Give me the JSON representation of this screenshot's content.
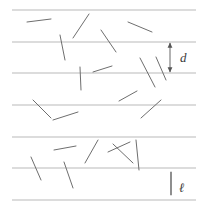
{
  "figure": {
    "name": "buffon-needle-diagram",
    "width": 206,
    "height": 208,
    "background_color": "#ffffff",
    "line_color": "#b9b9b9",
    "needle_color": "#6e6e6e",
    "annotation_color": "#555555",
    "label_color": "#3a3a3a"
  },
  "labels": {
    "spacing": "d",
    "needle_length": "ℓ"
  },
  "chart_data": {
    "type": "scatter",
    "xlabel": "",
    "ylabel": "",
    "grid": true,
    "legend": "none",
    "xlim": [
      0,
      206
    ],
    "ylim": [
      0,
      208
    ],
    "ruled_lines": {
      "orientation": "horizontal",
      "spacing_px": 31.5,
      "x_start": 12,
      "x_end": 196,
      "y_values": [
        10,
        42,
        73,
        105,
        137,
        168,
        200
      ]
    },
    "needles": [
      {
        "id": 1,
        "x1": 27,
        "y1": 22,
        "x2": 51,
        "y2": 19,
        "crosses": false
      },
      {
        "id": 2,
        "x1": 73,
        "y1": 38,
        "x2": 89,
        "y2": 14,
        "crosses": false
      },
      {
        "id": 3,
        "x1": 128,
        "y1": 22,
        "x2": 152,
        "y2": 32,
        "crosses": false
      },
      {
        "id": 4,
        "x1": 60,
        "y1": 35,
        "x2": 65,
        "y2": 60,
        "crosses": true
      },
      {
        "id": 5,
        "x1": 101,
        "y1": 30,
        "x2": 116,
        "y2": 52,
        "crosses": true
      },
      {
        "id": 6,
        "x1": 80,
        "y1": 67,
        "x2": 81,
        "y2": 90,
        "crosses": true
      },
      {
        "id": 7,
        "x1": 93,
        "y1": 72,
        "x2": 112,
        "y2": 66,
        "crosses": false
      },
      {
        "id": 8,
        "x1": 140,
        "y1": 58,
        "x2": 155,
        "y2": 87,
        "crosses": true
      },
      {
        "id": 9,
        "x1": 156,
        "y1": 57,
        "x2": 166,
        "y2": 80,
        "crosses": true
      },
      {
        "id": 10,
        "x1": 119,
        "y1": 101,
        "x2": 137,
        "y2": 91,
        "crosses": false
      },
      {
        "id": 11,
        "x1": 33,
        "y1": 100,
        "x2": 51,
        "y2": 118,
        "crosses": true
      },
      {
        "id": 12,
        "x1": 53,
        "y1": 120,
        "x2": 78,
        "y2": 112,
        "crosses": false
      },
      {
        "id": 13,
        "x1": 141,
        "y1": 118,
        "x2": 161,
        "y2": 100,
        "crosses": false
      },
      {
        "id": 14,
        "x1": 54,
        "y1": 150,
        "x2": 76,
        "y2": 146,
        "crosses": false
      },
      {
        "id": 15,
        "x1": 85,
        "y1": 163,
        "x2": 98,
        "y2": 140,
        "crosses": false
      },
      {
        "id": 16,
        "x1": 108,
        "y1": 152,
        "x2": 130,
        "y2": 142,
        "crosses": false
      },
      {
        "id": 17,
        "x1": 113,
        "y1": 144,
        "x2": 133,
        "y2": 163,
        "crosses": false
      },
      {
        "id": 18,
        "x1": 136,
        "y1": 140,
        "x2": 139,
        "y2": 170,
        "crosses": true
      },
      {
        "id": 19,
        "x1": 31,
        "y1": 157,
        "x2": 41,
        "y2": 180,
        "crosses": true
      },
      {
        "id": 20,
        "x1": 64,
        "y1": 162,
        "x2": 73,
        "y2": 188,
        "crosses": true
      },
      {
        "id": 21,
        "x1": 171,
        "y1": 172,
        "x2": 171,
        "y2": 195,
        "crosses": false
      }
    ],
    "annotations": [
      {
        "name": "spacing-dimension",
        "label": "d",
        "type": "double-arrow",
        "x": 170,
        "y_top": 42,
        "y_bottom": 73,
        "label_x": 180,
        "label_y": 62
      },
      {
        "name": "needle-length-reference",
        "label": "ℓ",
        "type": "reference-needle",
        "x": 171,
        "y_top": 172,
        "y_bottom": 195,
        "label_x": 179,
        "label_y": 192
      }
    ]
  }
}
